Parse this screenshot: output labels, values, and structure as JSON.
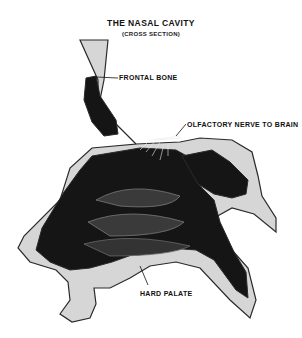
{
  "title": "THE NASAL CAVITY",
  "subtitle": "(CROSS SECTION)",
  "labels": {
    "frontal_bone": "FRONTAL BONE",
    "olfactory_nerve": "OLFACTORY NERVE TO BRAIN",
    "hard_palate": "HARD PALATE"
  },
  "colors": {
    "cavity": "#151515",
    "bone": "#d6d6d6",
    "outline": "#2a2a2a"
  }
}
